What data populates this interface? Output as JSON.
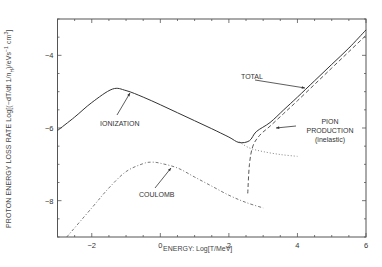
{
  "chart_data": {
    "type": "line",
    "title": "",
    "xlabel": "ENERGY: Log[T/MeV]",
    "ylabel": "PROTON ENERGY LOSS RATE Log[(-dT/dt 1/n_H)/eVs^-1 cm^3]",
    "xlim": [
      -3,
      6
    ],
    "ylim": [
      -9,
      -3
    ],
    "x_ticks": [
      -2,
      0,
      2,
      4,
      6
    ],
    "y_ticks": [
      -4,
      -6,
      -8
    ],
    "grid": false,
    "legend": "none (inline annotations)",
    "series": [
      {
        "name": "IONIZATION",
        "style": "solid-then-dotted",
        "x": [
          -3.0,
          -2.5,
          -2.0,
          -1.4,
          -1.0,
          -0.5,
          0.0,
          0.5,
          1.0,
          1.5,
          2.0,
          2.3,
          2.6,
          3.0,
          3.5,
          4.0
        ],
        "y": [
          -6.07,
          -5.7,
          -5.3,
          -4.93,
          -4.97,
          -5.15,
          -5.36,
          -5.58,
          -5.8,
          -6.02,
          -6.25,
          -6.38,
          -6.55,
          -6.65,
          -6.73,
          -6.78
        ]
      },
      {
        "name": "COULOMB",
        "style": "dash-dot",
        "x": [
          -2.73,
          -2.0,
          -1.5,
          -1.0,
          -0.5,
          -0.25,
          0.0,
          0.5,
          1.0,
          1.5,
          2.0,
          2.5,
          3.0
        ],
        "y": [
          -9.0,
          -8.2,
          -7.65,
          -7.2,
          -6.98,
          -6.94,
          -6.97,
          -7.1,
          -7.35,
          -7.6,
          -7.85,
          -8.05,
          -8.2
        ]
      },
      {
        "name": "PION PRODUCTION (inelastic)",
        "style": "dashed",
        "x": [
          2.55,
          2.6,
          2.7,
          2.9,
          3.2,
          3.6,
          4.0,
          4.5,
          5.0,
          5.5,
          6.0
        ],
        "y": [
          -7.8,
          -7.0,
          -6.5,
          -6.2,
          -5.95,
          -5.6,
          -5.25,
          -4.8,
          -4.35,
          -3.9,
          -3.45
        ]
      },
      {
        "name": "TOTAL",
        "style": "solid",
        "x": [
          -3.0,
          -2.5,
          -2.0,
          -1.4,
          -1.0,
          -0.5,
          0.0,
          0.5,
          1.0,
          1.5,
          2.0,
          2.3,
          2.6,
          2.8,
          3.2,
          3.6,
          4.0,
          4.5,
          5.0,
          5.5,
          6.0
        ],
        "y": [
          -6.07,
          -5.7,
          -5.3,
          -4.93,
          -4.97,
          -5.15,
          -5.36,
          -5.58,
          -5.8,
          -6.02,
          -6.25,
          -6.4,
          -6.35,
          -6.1,
          -5.85,
          -5.5,
          -5.15,
          -4.7,
          -4.25,
          -3.8,
          -3.3
        ]
      }
    ],
    "annotations": [
      {
        "text": "IONIZATION",
        "x": -0.3,
        "y": -5.9
      },
      {
        "text": "COULOMB",
        "x": 0.0,
        "y": -8.0
      },
      {
        "text": "TOTAL",
        "x": 2.8,
        "y": -4.9
      },
      {
        "text": "PION PRODUCTION (inelastic)",
        "x": 4.6,
        "y": -6.15
      }
    ]
  },
  "labels": {
    "x_axis": "ENERGY: Log[T/MeV]",
    "y_axis_prefix": "PROTON ENERGY LOSS RATE  Log[(−dT/dt  1/n",
    "y_axis_sub": "H",
    "y_axis_mid": ")/eVs",
    "y_axis_sup1": "−1",
    "y_axis_mid2": " cm",
    "y_axis_sup2": "3",
    "y_axis_end": "]",
    "ionization": "IONIZATION",
    "coulomb": "COULOMB",
    "total": "TOTAL",
    "pion_line1": "PION",
    "pion_line2": "PRODUCTION",
    "pion_line3": "(inelastic)"
  },
  "ticks": {
    "x": [
      "−2",
      "0",
      "2",
      "4",
      "6"
    ],
    "y": [
      "−4",
      "−6",
      "−8"
    ]
  }
}
